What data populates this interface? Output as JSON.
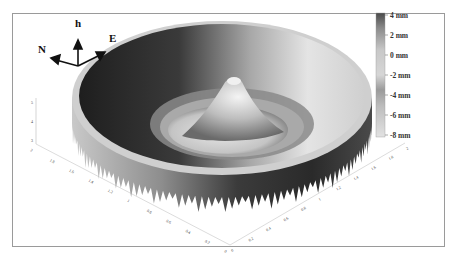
{
  "chart_data": {
    "type": "surface3d",
    "title": "",
    "xlabel": "",
    "ylabel": "",
    "zlabel": "",
    "x_axis": {
      "range": [
        0,
        2
      ],
      "ticks": [
        "2",
        "1.8",
        "1.6",
        "1.4",
        "1.2",
        "1",
        "0.8",
        "0.6",
        "0.4",
        "0.2",
        "0"
      ]
    },
    "y_axis": {
      "range": [
        0,
        2
      ],
      "ticks": [
        "0",
        "0.2",
        "0.4",
        "0.6",
        "0.8",
        "1",
        "1.2",
        "1.4",
        "1.6",
        "1.8",
        "2"
      ]
    },
    "z_axis": {
      "ticks": [
        "5",
        "4",
        "3"
      ]
    },
    "colorbar": {
      "unit": "mm",
      "range": [
        -8,
        4
      ],
      "ticks": [
        "4 mm",
        "2 mm",
        "0 mm",
        "-2 mm",
        "-4 mm",
        "-6 mm",
        "-8 mm"
      ],
      "tick_values": [
        4,
        2,
        0,
        -2,
        -4,
        -6,
        -8
      ],
      "colormap": "grayscale",
      "low_color": "#d8d8d8",
      "high_color": "#3a3a3a"
    },
    "surface_profile": {
      "radial_profile": [
        {
          "r": 0.0,
          "h": 1
        },
        {
          "r": 0.1,
          "h": -3
        },
        {
          "r": 0.25,
          "h": -6
        },
        {
          "r": 0.35,
          "h": -7
        },
        {
          "r": 0.45,
          "h": -5
        },
        {
          "r": 0.6,
          "h": -2
        },
        {
          "r": 0.8,
          "h": 2
        },
        {
          "r": 0.95,
          "h": 4
        }
      ],
      "center": [
        1,
        1
      ]
    },
    "grid": false,
    "legend": "right"
  },
  "compass": {
    "up_label": "h",
    "north_label": "N",
    "east_label": "E"
  }
}
